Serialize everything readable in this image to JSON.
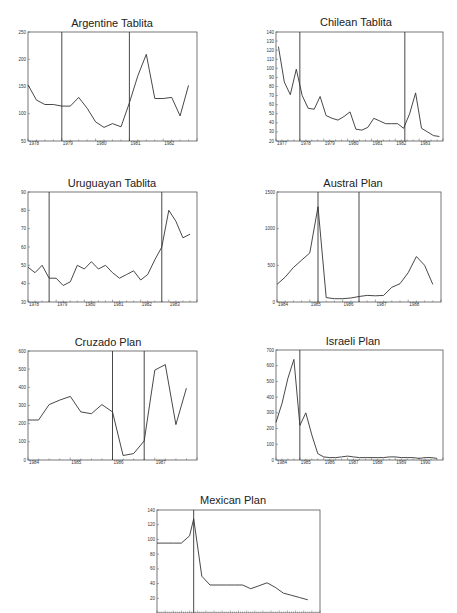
{
  "chart_data": [
    {
      "type": "line",
      "title": "Argentine Tablita",
      "xlabel": "",
      "ylabel": "",
      "ylim": [
        50,
        250
      ],
      "yticks": [
        50,
        100,
        150,
        200,
        250
      ],
      "xlim": [
        1978,
        1983
      ],
      "xticks": [
        "1978",
        "1979",
        "1980",
        "1981",
        "1982"
      ],
      "xtick_values": [
        1978,
        1979,
        1980,
        1981,
        1982
      ],
      "vlines": [
        1979,
        1981
      ],
      "x": [
        1978.0,
        1978.25,
        1978.5,
        1978.75,
        1979.0,
        1979.25,
        1979.5,
        1979.75,
        1980.0,
        1980.25,
        1980.5,
        1980.75,
        1981.0,
        1981.25,
        1981.5,
        1981.75,
        1982.0,
        1982.25,
        1982.5,
        1982.75
      ],
      "values": [
        153,
        125,
        117,
        117,
        114,
        114,
        130,
        110,
        85,
        75,
        82,
        76,
        120,
        170,
        209,
        128,
        128,
        130,
        96,
        152
      ]
    },
    {
      "type": "line",
      "title": "Chilean Tablita",
      "xlabel": "",
      "ylabel": "",
      "ylim": [
        20,
        140
      ],
      "yticks": [
        20,
        30,
        40,
        50,
        60,
        70,
        80,
        90,
        100,
        110,
        120,
        130,
        140
      ],
      "xlim": [
        1977,
        1984
      ],
      "xticks": [
        "1977",
        "1978",
        "1979",
        "1980",
        "1981",
        "1982",
        "1983"
      ],
      "xtick_values": [
        1977,
        1978,
        1979,
        1980,
        1981,
        1982,
        1983
      ],
      "vlines": [
        1978,
        1982.4
      ],
      "x": [
        1977.1,
        1977.35,
        1977.6,
        1977.85,
        1978.1,
        1978.35,
        1978.6,
        1978.85,
        1979.1,
        1979.35,
        1979.6,
        1979.85,
        1980.1,
        1980.35,
        1980.6,
        1980.85,
        1981.1,
        1981.35,
        1981.6,
        1981.85,
        1982.1,
        1982.35,
        1982.6,
        1982.85,
        1983.1,
        1983.35,
        1983.6,
        1983.85
      ],
      "values": [
        124,
        85,
        71,
        99,
        70,
        56,
        55,
        69,
        48,
        45,
        43,
        47,
        52,
        33,
        32,
        35,
        45,
        42,
        39,
        39,
        39,
        34,
        50,
        73,
        34,
        30,
        26,
        25
      ]
    },
    {
      "type": "line",
      "title": "Uruguayan Tablita",
      "xlabel": "",
      "ylabel": "",
      "ylim": [
        30,
        90
      ],
      "yticks": [
        30,
        40,
        50,
        60,
        70,
        80,
        90
      ],
      "xlim": [
        1978,
        1984
      ],
      "xticks": [
        "1978",
        "1979",
        "1980",
        "1981",
        "1982",
        "1983"
      ],
      "xtick_values": [
        1978,
        1979,
        1980,
        1981,
        1982,
        1983
      ],
      "vlines": [
        1978.75,
        1982.75
      ],
      "x": [
        1978.0,
        1978.25,
        1978.5,
        1978.75,
        1979.0,
        1979.25,
        1979.5,
        1979.75,
        1980.0,
        1980.25,
        1980.5,
        1980.75,
        1981.0,
        1981.25,
        1981.5,
        1981.75,
        1982.0,
        1982.25,
        1982.5,
        1982.75,
        1983.0,
        1983.25,
        1983.5,
        1983.75
      ],
      "values": [
        49,
        46,
        50,
        43,
        43,
        39,
        41,
        50,
        48,
        52,
        48,
        50,
        46,
        43,
        45,
        47,
        42,
        45,
        53,
        60,
        80,
        74,
        65,
        67
      ]
    },
    {
      "type": "line",
      "title": "Austral Plan",
      "xlabel": "",
      "ylabel": "",
      "ylim": [
        0,
        1500
      ],
      "yticks": [
        0,
        500,
        1000,
        1500
      ],
      "xlim": [
        1984,
        1989
      ],
      "xticks": [
        "1984",
        "1985",
        "1986",
        "1987",
        "1988"
      ],
      "xtick_values": [
        1984,
        1985,
        1986,
        1987,
        1988
      ],
      "vlines": [
        1985.25,
        1986.5
      ],
      "x": [
        1984.0,
        1984.25,
        1984.5,
        1984.75,
        1985.0,
        1985.25,
        1985.5,
        1985.75,
        1986.0,
        1986.25,
        1986.5,
        1986.75,
        1987.0,
        1987.25,
        1987.5,
        1987.75,
        1988.0,
        1988.25,
        1988.5,
        1988.75
      ],
      "values": [
        240,
        340,
        470,
        570,
        670,
        1300,
        60,
        45,
        45,
        55,
        75,
        90,
        85,
        90,
        200,
        250,
        400,
        620,
        500,
        240
      ]
    },
    {
      "type": "line",
      "title": "Cruzado Plan",
      "xlabel": "",
      "ylabel": "",
      "ylim": [
        0,
        600
      ],
      "yticks": [
        0,
        100,
        200,
        300,
        400,
        500,
        600
      ],
      "xlim": [
        1984,
        1988
      ],
      "xticks": [
        "1984",
        "1985",
        "1986",
        "1987"
      ],
      "xtick_values": [
        1984,
        1985,
        1986,
        1987
      ],
      "vlines": [
        1986,
        1986.75
      ],
      "x": [
        1984.0,
        1984.25,
        1984.5,
        1984.75,
        1985.0,
        1985.25,
        1985.5,
        1985.75,
        1986.0,
        1986.25,
        1986.5,
        1986.75,
        1987.0,
        1987.25,
        1987.5,
        1987.75
      ],
      "values": [
        220,
        220,
        305,
        330,
        350,
        265,
        255,
        305,
        265,
        25,
        35,
        105,
        495,
        525,
        195,
        395
      ]
    },
    {
      "type": "line",
      "title": "Israeli Plan",
      "xlabel": "",
      "ylabel": "",
      "ylim": [
        0,
        700
      ],
      "yticks": [
        0,
        100,
        200,
        300,
        400,
        500,
        600,
        700
      ],
      "xlim": [
        1984,
        1991
      ],
      "xticks": [
        "1984",
        "1985",
        "1986",
        "1987",
        "1988",
        "1989",
        "1990"
      ],
      "xtick_values": [
        1984,
        1985,
        1986,
        1987,
        1988,
        1989,
        1990
      ],
      "vlines": [
        1985
      ],
      "x": [
        1984.0,
        1984.25,
        1984.5,
        1984.75,
        1985.0,
        1985.25,
        1985.5,
        1985.75,
        1986.0,
        1986.25,
        1986.5,
        1986.75,
        1987.0,
        1987.25,
        1987.5,
        1987.75,
        1988.0,
        1988.25,
        1988.5,
        1988.75,
        1989.0,
        1989.25,
        1989.5,
        1989.75,
        1990.0,
        1990.25,
        1990.5,
        1990.75
      ],
      "values": [
        240,
        360,
        520,
        640,
        220,
        300,
        160,
        40,
        20,
        15,
        15,
        20,
        25,
        20,
        15,
        15,
        15,
        15,
        15,
        20,
        20,
        15,
        15,
        15,
        10,
        15,
        15,
        10
      ]
    },
    {
      "type": "line",
      "title": "Mexican Plan",
      "xlabel": "",
      "ylabel": "",
      "ylim": [
        0,
        140
      ],
      "yticks": [
        20,
        40,
        60,
        80,
        100,
        120,
        140
      ],
      "xlim": [
        0,
        20
      ],
      "xticks": [],
      "xtick_values": [],
      "vlines": [
        4.5
      ],
      "x": [
        0,
        1,
        2,
        3,
        4,
        4.5,
        5.5,
        6.5,
        7.5,
        8.5,
        9.5,
        10.5,
        11.5,
        12.5,
        13.5,
        14.5,
        15.5,
        16.5,
        17.5,
        18.5
      ],
      "values": [
        95,
        95,
        95,
        95,
        105,
        128,
        50,
        38,
        38,
        38,
        38,
        38,
        33,
        37,
        41,
        35,
        27,
        24,
        21,
        18
      ]
    }
  ],
  "page": {
    "top_cut_text_left": "",
    "top_cut_text_right": ""
  }
}
